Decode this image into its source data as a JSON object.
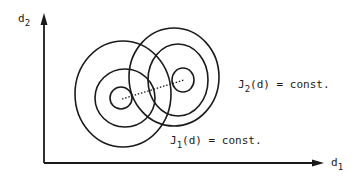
{
  "figure": {
    "axes": {
      "x_label": "d",
      "x_label_sub": "1",
      "y_label": "d",
      "y_label_sub": "2"
    },
    "contour_sets": [
      {
        "name": "J1",
        "label_main": "J",
        "label_sub": "1",
        "label_rest": "(d) = const.",
        "center": [
          122,
          98
        ],
        "levels": 3
      },
      {
        "name": "J2",
        "label_main": "J",
        "label_sub": "2",
        "label_rest": "(d) = const.",
        "center": [
          183,
          80
        ],
        "levels": 3
      }
    ],
    "connector": "dotted line between minima",
    "colors": {
      "ink": "#1a1a1a",
      "background": "#ffffff"
    }
  }
}
